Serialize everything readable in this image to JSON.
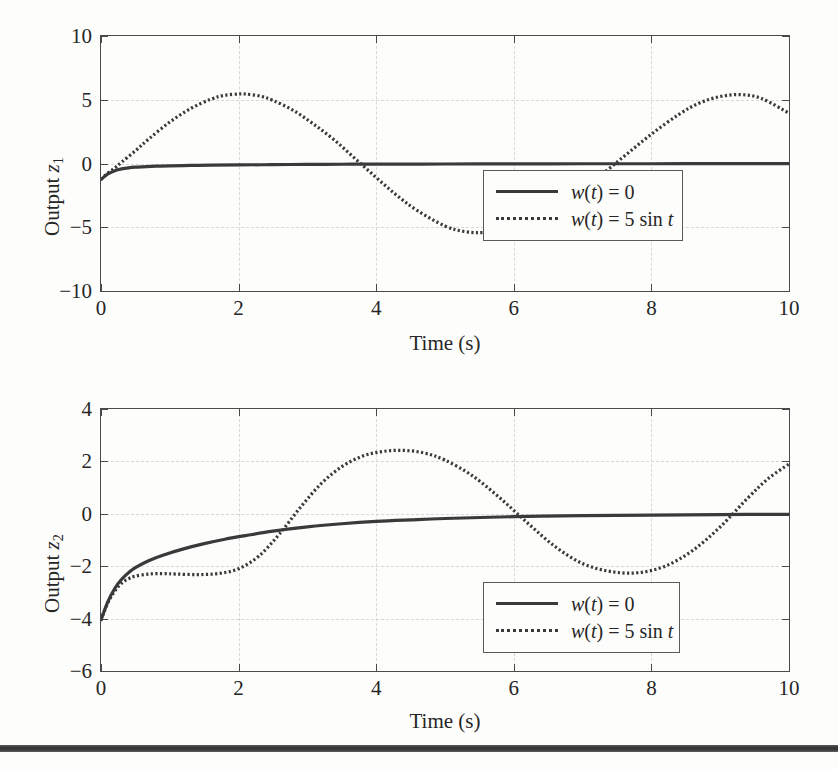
{
  "page": {
    "background_color": "#fdfdfc",
    "ink_color": "#3a3a3a",
    "scan_bar": {
      "name": "page-edge-artifact"
    }
  },
  "legend_common": {
    "entries": [
      {
        "label_html": "<span class=\"mvar\">w</span>(<span class=\"mvar\">t</span>) = 0",
        "style": "solid"
      },
      {
        "label_html": "<span class=\"mvar\">w</span>(<span class=\"mvar\">t</span>) = 5 sin <span class=\"mvar\">t</span>",
        "style": "dotted"
      }
    ]
  },
  "chart_data": [
    {
      "id": "chart-output-z1",
      "type": "line",
      "title": "",
      "xlabel": "Time (s)",
      "ylabel_html": "Output <span class=\"mvar\">z</span><sub>1</sub>",
      "ylabel_text": "Output z1",
      "xlim": [
        0,
        10
      ],
      "ylim": [
        -10,
        10
      ],
      "xticks": [
        0,
        2,
        4,
        6,
        8,
        10
      ],
      "yticks": [
        10,
        5,
        0,
        -5,
        -10
      ],
      "ytick_labels": [
        "10",
        "5",
        "0",
        "−5",
        "−10"
      ],
      "xtick_labels": [
        "0",
        "2",
        "4",
        "6",
        "8",
        "10"
      ],
      "grid": true,
      "legend_position": "lower right",
      "series": [
        {
          "name": "w(t) = 0",
          "style": "solid",
          "x": [
            0,
            0.1,
            0.2,
            0.3,
            0.4,
            0.5,
            0.6,
            0.8,
            1.0,
            1.3,
            1.6,
            2.0,
            2.5,
            3.0,
            3.5,
            4.0,
            5.0,
            6.0,
            7.0,
            8.0,
            9.0,
            10.0
          ],
          "y": [
            -1.25,
            -0.82,
            -0.56,
            -0.42,
            -0.34,
            -0.29,
            -0.26,
            -0.21,
            -0.18,
            -0.15,
            -0.13,
            -0.11,
            -0.09,
            -0.07,
            -0.06,
            -0.05,
            -0.04,
            -0.03,
            -0.02,
            -0.02,
            -0.01,
            -0.01
          ]
        },
        {
          "name": "w(t) = 5 sin t",
          "style": "dotted",
          "x": [
            0,
            0.1,
            0.2,
            0.3,
            0.5,
            0.7,
            1.0,
            1.3,
            1.6,
            1.8,
            2.0,
            2.1,
            2.3,
            2.5,
            2.8,
            3.1,
            3.4,
            3.7,
            4.0,
            4.3,
            4.6,
            5.0,
            5.3,
            5.6,
            6.0,
            6.4,
            6.8,
            7.2,
            7.6,
            8.0,
            8.4,
            8.7,
            9.0,
            9.3,
            9.6,
            10.0
          ],
          "y": [
            -1.25,
            -0.75,
            -0.35,
            0.1,
            1.0,
            1.95,
            3.25,
            4.3,
            5.05,
            5.35,
            5.45,
            5.45,
            5.3,
            4.95,
            4.15,
            3.05,
            1.8,
            0.35,
            -1.1,
            -2.5,
            -3.7,
            -4.9,
            -5.35,
            -5.4,
            -5.1,
            -4.2,
            -2.8,
            -1.2,
            0.55,
            2.3,
            3.85,
            4.75,
            5.25,
            5.4,
            5.1,
            3.95
          ]
        }
      ]
    },
    {
      "id": "chart-output-z2",
      "type": "line",
      "title": "",
      "xlabel": "Time (s)",
      "ylabel_html": "Output <span class=\"mvar\">z</span><sub>2</sub>",
      "ylabel_text": "Output z2",
      "xlim": [
        0,
        10
      ],
      "ylim": [
        -6,
        4
      ],
      "xticks": [
        0,
        2,
        4,
        6,
        8,
        10
      ],
      "yticks": [
        4,
        2,
        0,
        -2,
        -4,
        -6
      ],
      "ytick_labels": [
        "4",
        "2",
        "0",
        "−2",
        "−4",
        "−6"
      ],
      "xtick_labels": [
        "0",
        "2",
        "4",
        "6",
        "8",
        "10"
      ],
      "grid": true,
      "legend_position": "lower right",
      "series": [
        {
          "name": "w(t) = 0",
          "style": "solid",
          "x": [
            0,
            0.1,
            0.2,
            0.3,
            0.4,
            0.5,
            0.7,
            0.9,
            1.2,
            1.5,
            1.8,
            2.1,
            2.5,
            3.0,
            3.5,
            4.0,
            4.5,
            5.0,
            6.0,
            7.0,
            8.0,
            9.0,
            10.0
          ],
          "y": [
            -4.05,
            -3.35,
            -2.85,
            -2.5,
            -2.25,
            -2.05,
            -1.78,
            -1.58,
            -1.34,
            -1.14,
            -0.97,
            -0.83,
            -0.66,
            -0.5,
            -0.38,
            -0.29,
            -0.23,
            -0.18,
            -0.11,
            -0.07,
            -0.05,
            -0.03,
            -0.02
          ]
        },
        {
          "name": "w(t) = 5 sin t",
          "style": "dotted",
          "x": [
            0,
            0.1,
            0.2,
            0.3,
            0.4,
            0.5,
            0.7,
            0.9,
            1.1,
            1.4,
            1.7,
            2.0,
            2.3,
            2.6,
            2.9,
            3.2,
            3.5,
            3.8,
            4.1,
            4.4,
            4.7,
            5.0,
            5.4,
            5.8,
            6.2,
            6.6,
            7.0,
            7.4,
            7.8,
            8.2,
            8.6,
            9.0,
            9.4,
            9.7,
            10.0
          ],
          "y": [
            -4.05,
            -3.4,
            -2.95,
            -2.65,
            -2.48,
            -2.38,
            -2.3,
            -2.28,
            -2.3,
            -2.32,
            -2.28,
            -2.1,
            -1.6,
            -0.75,
            0.25,
            1.15,
            1.8,
            2.2,
            2.38,
            2.42,
            2.32,
            2.05,
            1.45,
            0.6,
            -0.35,
            -1.25,
            -1.9,
            -2.2,
            -2.25,
            -2.0,
            -1.4,
            -0.5,
            0.6,
            1.35,
            1.9
          ]
        }
      ]
    }
  ]
}
